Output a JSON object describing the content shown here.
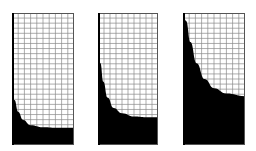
{
  "figure": {
    "colors": {
      "fill": "#000000",
      "grid": "#8a8a8a",
      "border": "#555555",
      "background": "#ffffff"
    },
    "grid": {
      "columns": 10,
      "rows": 26
    },
    "panels": [
      {
        "id": "panel-1",
        "x": 12,
        "y": 13,
        "width": 62,
        "height": 132,
        "curve": [
          [
            0,
            0.54
          ],
          [
            0.04,
            0.66
          ],
          [
            0.1,
            0.75
          ],
          [
            0.18,
            0.81
          ],
          [
            0.3,
            0.85
          ],
          [
            0.5,
            0.865
          ],
          [
            0.75,
            0.87
          ],
          [
            1,
            0.87
          ]
        ]
      },
      {
        "id": "panel-2",
        "x": 98,
        "y": 13,
        "width": 60,
        "height": 132,
        "curve": [
          [
            0,
            0.3
          ],
          [
            0.04,
            0.38
          ],
          [
            0.09,
            0.52
          ],
          [
            0.16,
            0.64
          ],
          [
            0.26,
            0.72
          ],
          [
            0.4,
            0.76
          ],
          [
            0.6,
            0.785
          ],
          [
            0.8,
            0.79
          ],
          [
            1,
            0.79
          ]
        ]
      },
      {
        "id": "panel-3",
        "x": 183,
        "y": 13,
        "width": 62,
        "height": 132,
        "curve": [
          [
            0,
            0.0
          ],
          [
            0.05,
            0.06
          ],
          [
            0.12,
            0.22
          ],
          [
            0.22,
            0.38
          ],
          [
            0.35,
            0.5
          ],
          [
            0.5,
            0.57
          ],
          [
            0.7,
            0.61
          ],
          [
            1,
            0.63
          ]
        ]
      }
    ]
  }
}
